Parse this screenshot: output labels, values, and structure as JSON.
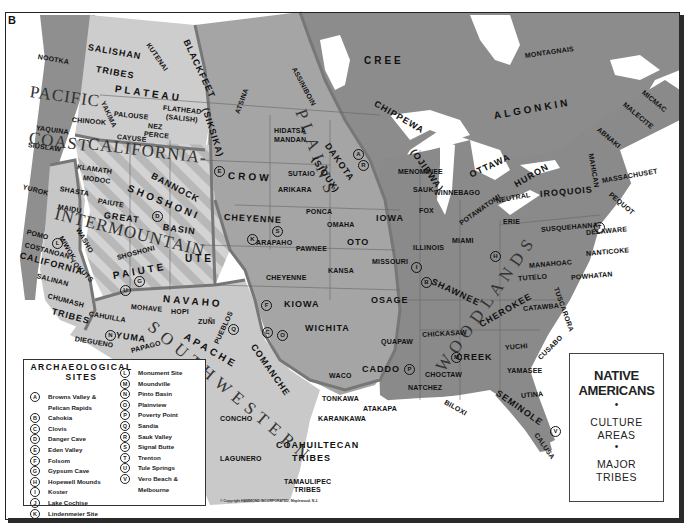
{
  "corner_label": "B",
  "title_box": {
    "title_line1": "NATIVE",
    "title_line2": "AMERICANS",
    "bullet": "•",
    "sub1_line1": "CULTURE",
    "sub1_line2": "AREAS",
    "sub2_line1": "MAJOR",
    "sub2_line2": "TRIBES"
  },
  "legend": {
    "title_line1": "ARCHAEOLOGICAL",
    "title_line2": "SITES",
    "left": [
      {
        "key": "A",
        "name": "Browns Valley &",
        "name2": "Pelican Rapids"
      },
      {
        "key": "B",
        "name": "Cahokia"
      },
      {
        "key": "C",
        "name": "Clovis"
      },
      {
        "key": "D",
        "name": "Danger Cave"
      },
      {
        "key": "E",
        "name": "Eden Valley"
      },
      {
        "key": "F",
        "name": "Folsom"
      },
      {
        "key": "G",
        "name": "Gypsum Cave"
      },
      {
        "key": "H",
        "name": "Hopewell Mounds"
      },
      {
        "key": "I",
        "name": "Koster"
      },
      {
        "key": "J",
        "name": "Lake Cochise"
      },
      {
        "key": "K",
        "name": "Lindenmeier Site"
      }
    ],
    "right": [
      {
        "key": "L",
        "name": "Monument Site"
      },
      {
        "key": "M",
        "name": "Moundville"
      },
      {
        "key": "N",
        "name": "Pinto Basin"
      },
      {
        "key": "O",
        "name": "Plainview"
      },
      {
        "key": "P",
        "name": "Poverty Point"
      },
      {
        "key": "Q",
        "name": "Sandia"
      },
      {
        "key": "R",
        "name": "Sauk Valley"
      },
      {
        "key": "S",
        "name": "Signal Butte"
      },
      {
        "key": "T",
        "name": "Trenton"
      },
      {
        "key": "U",
        "name": "Tule Springs"
      },
      {
        "key": "V",
        "name": "Vero Beach &",
        "name2": "Melbourne"
      }
    ]
  },
  "copyright": "© Copyright HAMMOND INCORPORATED, Maplewood, N.J.",
  "culture_areas": [
    {
      "id": "pacific",
      "text": "PACIFIC",
      "x": 30,
      "y": 82,
      "rot": 8
    },
    {
      "id": "coast",
      "text": "COAST",
      "x": 29,
      "y": 128,
      "rot": 8
    },
    {
      "id": "california1",
      "text": "CALIFORNIA-",
      "x": 88,
      "y": 134,
      "rot": 7
    },
    {
      "id": "intermountain",
      "text": "INTERMOUNTAIN",
      "x": 55,
      "y": 204,
      "rot": 14
    },
    {
      "id": "plains",
      "text": "P  L  A  I  N  S",
      "x": 300,
      "y": 100,
      "rot": 70
    },
    {
      "id": "southwestern",
      "text": "S O U T H W E S T E R N",
      "x": 150,
      "y": 315,
      "rot": 40
    },
    {
      "id": "woodlands",
      "text": "W O O D L A N D S",
      "x": 440,
      "y": 360,
      "rot": -55
    }
  ],
  "tribes": [
    {
      "t": "NOOTKA",
      "x": 38,
      "y": 53,
      "rot": 10
    },
    {
      "t": "SALISHAN",
      "x": 88,
      "y": 42,
      "rot": 10,
      "c": "mid"
    },
    {
      "t": "TRIBES",
      "x": 96,
      "y": 64,
      "rot": 10,
      "c": "mid"
    },
    {
      "t": "KUTENAI",
      "x": 148,
      "y": 40,
      "rot": 55
    },
    {
      "t": "BLACKFEET",
      "x": 186,
      "y": 35,
      "rot": 65,
      "c": "mid"
    },
    {
      "t": "(SIKSIKA)",
      "x": 205,
      "y": 103,
      "rot": 72,
      "c": "mid"
    },
    {
      "t": "PLATEAU",
      "x": 115,
      "y": 83,
      "rot": 8,
      "c": "big"
    },
    {
      "t": "FLATHEAD",
      "x": 163,
      "y": 104,
      "rot": 6
    },
    {
      "t": "(SALISH)",
      "x": 166,
      "y": 113,
      "rot": 6
    },
    {
      "t": "YAKIMA",
      "x": 103,
      "y": 98,
      "rot": 65
    },
    {
      "t": "PALOUSE",
      "x": 114,
      "y": 110,
      "rot": 6
    },
    {
      "t": "CHINOOK",
      "x": 72,
      "y": 116,
      "rot": 5
    },
    {
      "t": "NEZ",
      "x": 148,
      "y": 122,
      "rot": 6
    },
    {
      "t": "PERCE",
      "x": 144,
      "y": 130,
      "rot": 6
    },
    {
      "t": "CAYUSE",
      "x": 117,
      "y": 133,
      "rot": 6
    },
    {
      "t": "YAQUINA",
      "x": 36,
      "y": 124,
      "rot": 8
    },
    {
      "t": "SIUSLAW",
      "x": 28,
      "y": 141,
      "rot": 8
    },
    {
      "t": "KLAMATH",
      "x": 77,
      "y": 163,
      "rot": 8
    },
    {
      "t": "MODOC",
      "x": 83,
      "y": 174,
      "rot": 8
    },
    {
      "t": "BANNOCK",
      "x": 152,
      "y": 170,
      "rot": 28,
      "c": "mid"
    },
    {
      "t": "SHOSHONI",
      "x": 128,
      "y": 182,
      "rot": 22,
      "c": "big"
    },
    {
      "t": "YUROK",
      "x": 23,
      "y": 183,
      "rot": 15
    },
    {
      "t": "SHASTA",
      "x": 60,
      "y": 185,
      "rot": 10
    },
    {
      "t": "PAIUTE",
      "x": 98,
      "y": 197,
      "rot": 10
    },
    {
      "t": "MAIDU",
      "x": 58,
      "y": 203,
      "rot": 10
    },
    {
      "t": "GREAT",
      "x": 104,
      "y": 210,
      "rot": 8,
      "c": "mid"
    },
    {
      "t": "BASIN",
      "x": 163,
      "y": 222,
      "rot": 8,
      "c": "mid"
    },
    {
      "t": "WASHO",
      "x": 78,
      "y": 225,
      "rot": 60
    },
    {
      "t": "POMO",
      "x": 27,
      "y": 228,
      "rot": 15
    },
    {
      "t": "MIWOK",
      "x": 61,
      "y": 233,
      "rot": 60
    },
    {
      "t": "COSTANOAN",
      "x": 25,
      "y": 241,
      "rot": 15
    },
    {
      "t": "CALIFORNIA",
      "x": 20,
      "y": 250,
      "rot": 15,
      "c": "mid"
    },
    {
      "t": "YOKUTS",
      "x": 71,
      "y": 256,
      "rot": 45
    },
    {
      "t": "UTE",
      "x": 185,
      "y": 253,
      "rot": 0,
      "c": "big"
    },
    {
      "t": "SHOSHONI",
      "x": 117,
      "y": 254,
      "rot": -15
    },
    {
      "t": "PAIUTE",
      "x": 113,
      "y": 270,
      "rot": -10,
      "c": "big"
    },
    {
      "t": "SALINAN",
      "x": 37,
      "y": 272,
      "rot": 15
    },
    {
      "t": "CHUMASH",
      "x": 48,
      "y": 292,
      "rot": 15
    },
    {
      "t": "TRIBES",
      "x": 52,
      "y": 306,
      "rot": 15,
      "c": "mid"
    },
    {
      "t": "CAHUILLA",
      "x": 89,
      "y": 310,
      "rot": 10
    },
    {
      "t": "DIEGUENO",
      "x": 75,
      "y": 335,
      "rot": 10
    },
    {
      "t": "YUMA",
      "x": 116,
      "y": 330,
      "rot": 8,
      "c": "mid"
    },
    {
      "t": "MOHAVE",
      "x": 131,
      "y": 303,
      "rot": 5
    },
    {
      "t": "NAVAHO",
      "x": 163,
      "y": 293,
      "rot": 5,
      "c": "big"
    },
    {
      "t": "HOPI",
      "x": 171,
      "y": 308,
      "rot": 0
    },
    {
      "t": "ZUÑI",
      "x": 198,
      "y": 318,
      "rot": 0
    },
    {
      "t": "PAPAGO",
      "x": 131,
      "y": 347,
      "rot": -15
    },
    {
      "t": "PIMA",
      "x": 151,
      "y": 362,
      "rot": 5
    },
    {
      "t": "PUEBLOS",
      "x": 216,
      "y": 340,
      "rot": -65
    },
    {
      "t": "APACHE",
      "x": 185,
      "y": 330,
      "rot": 30,
      "c": "big"
    },
    {
      "t": "ATSINA",
      "x": 237,
      "y": 110,
      "rot": -70
    },
    {
      "t": "ASSINIBOIN",
      "x": 294,
      "y": 64,
      "rot": 62
    },
    {
      "t": "CROW",
      "x": 228,
      "y": 170,
      "rot": 3,
      "c": "big"
    },
    {
      "t": "HIDATSA",
      "x": 274,
      "y": 127,
      "rot": 0
    },
    {
      "t": "MANDAN",
      "x": 274,
      "y": 136,
      "rot": 0
    },
    {
      "t": "DAKOTA",
      "x": 327,
      "y": 139,
      "rot": 55,
      "c": "mid"
    },
    {
      "t": "(SIOUX)",
      "x": 314,
      "y": 153,
      "rot": 55,
      "c": "mid"
    },
    {
      "t": "SUTAIO",
      "x": 288,
      "y": 170,
      "rot": 0
    },
    {
      "t": "ARIKARA",
      "x": 278,
      "y": 186,
      "rot": 0
    },
    {
      "t": "CHEYENNE",
      "x": 224,
      "y": 212,
      "rot": 3,
      "c": "mid"
    },
    {
      "t": "PONCA",
      "x": 306,
      "y": 208,
      "rot": 0
    },
    {
      "t": "OMAHA",
      "x": 327,
      "y": 221,
      "rot": 0
    },
    {
      "t": "ARAPAHO",
      "x": 256,
      "y": 239,
      "rot": 0
    },
    {
      "t": "OTO",
      "x": 347,
      "y": 237,
      "rot": 0,
      "c": "mid"
    },
    {
      "t": "PAWNEE",
      "x": 296,
      "y": 245,
      "rot": 0
    },
    {
      "t": "KANSA",
      "x": 328,
      "y": 267,
      "rot": 0
    },
    {
      "t": "CHEYENNE",
      "x": 266,
      "y": 274,
      "rot": 0
    },
    {
      "t": "KIOWA",
      "x": 284,
      "y": 299,
      "rot": 0,
      "c": "mid"
    },
    {
      "t": "WICHITA",
      "x": 305,
      "y": 323,
      "rot": 0,
      "c": "mid"
    },
    {
      "t": "COMANCHE",
      "x": 253,
      "y": 340,
      "rot": 55,
      "c": "mid"
    },
    {
      "t": "IOWA",
      "x": 376,
      "y": 213,
      "rot": 0,
      "c": "mid"
    },
    {
      "t": "MISSOURI",
      "x": 372,
      "y": 258,
      "rot": 0
    },
    {
      "t": "OSAGE",
      "x": 371,
      "y": 295,
      "rot": 0,
      "c": "mid"
    },
    {
      "t": "QUAPAW",
      "x": 381,
      "y": 338,
      "rot": 0
    },
    {
      "t": "CADDO",
      "x": 362,
      "y": 364,
      "rot": 0,
      "c": "mid"
    },
    {
      "t": "WACO",
      "x": 329,
      "y": 372,
      "rot": 0
    },
    {
      "t": "TONKAWA",
      "x": 322,
      "y": 395,
      "rot": 0
    },
    {
      "t": "KARANKAWA",
      "x": 318,
      "y": 415,
      "rot": 0
    },
    {
      "t": "ATAKAPA",
      "x": 363,
      "y": 405,
      "rot": 0
    },
    {
      "t": "COAHUILTECAN",
      "x": 276,
      "y": 440,
      "rot": 0,
      "c": "mid"
    },
    {
      "t": "TRIBES",
      "x": 292,
      "y": 453,
      "rot": 0,
      "c": "mid"
    },
    {
      "t": "TAMAULIPEC",
      "x": 284,
      "y": 478,
      "rot": 0
    },
    {
      "t": "TRIBES",
      "x": 294,
      "y": 486,
      "rot": 0
    },
    {
      "t": "CONCHO",
      "x": 220,
      "y": 415,
      "rot": 0
    },
    {
      "t": "LAGUNERO",
      "x": 220,
      "y": 455,
      "rot": 0
    },
    {
      "t": "CREE",
      "x": 364,
      "y": 55,
      "rot": 0,
      "c": "big"
    },
    {
      "t": "MONTAGNAIS",
      "x": 525,
      "y": 52,
      "rot": -8
    },
    {
      "t": "CHIPPEWA",
      "x": 375,
      "y": 98,
      "rot": 30,
      "c": "mid"
    },
    {
      "t": "ALGONKIN",
      "x": 494,
      "y": 110,
      "rot": -10,
      "c": "big"
    },
    {
      "t": "(OJIBWA)",
      "x": 413,
      "y": 145,
      "rot": 55,
      "c": "mid"
    },
    {
      "t": "OTTAWA",
      "x": 470,
      "y": 170,
      "rot": -25,
      "c": "mid"
    },
    {
      "t": "MENOMINEE",
      "x": 398,
      "y": 168,
      "rot": 0
    },
    {
      "t": "SAUK",
      "x": 413,
      "y": 186,
      "rot": 0
    },
    {
      "t": "WINNEBAGO",
      "x": 434,
      "y": 189,
      "rot": 0
    },
    {
      "t": "FOX",
      "x": 419,
      "y": 207,
      "rot": 0
    },
    {
      "t": "POTAWATOMI",
      "x": 460,
      "y": 220,
      "rot": -35
    },
    {
      "t": "NEUTRAL",
      "x": 496,
      "y": 197,
      "rot": -10
    },
    {
      "t": "HURON",
      "x": 515,
      "y": 180,
      "rot": -30,
      "c": "mid"
    },
    {
      "t": "IROQUOIS",
      "x": 540,
      "y": 189,
      "rot": -5,
      "c": "mid"
    },
    {
      "t": "ERIE",
      "x": 503,
      "y": 218,
      "rot": 0
    },
    {
      "t": "ILLINOIS",
      "x": 413,
      "y": 244,
      "rot": 0
    },
    {
      "t": "MIAMI",
      "x": 452,
      "y": 237,
      "rot": 0
    },
    {
      "t": "SHAWNEE",
      "x": 432,
      "y": 276,
      "rot": 25,
      "c": "mid"
    },
    {
      "t": "SUSQUEHANNA",
      "x": 541,
      "y": 226,
      "rot": -5
    },
    {
      "t": "DELAWARE",
      "x": 586,
      "y": 229,
      "rot": -5
    },
    {
      "t": "NANTICOKE",
      "x": 586,
      "y": 250,
      "rot": -5
    },
    {
      "t": "MANAHOAC",
      "x": 529,
      "y": 262,
      "rot": -5
    },
    {
      "t": "TUTELO",
      "x": 518,
      "y": 275,
      "rot": -5
    },
    {
      "t": "POWHATAN",
      "x": 571,
      "y": 274,
      "rot": -5
    },
    {
      "t": "TUSCARORA",
      "x": 556,
      "y": 284,
      "rot": 70
    },
    {
      "t": "CATAWBA",
      "x": 523,
      "y": 305,
      "rot": -5
    },
    {
      "t": "CHEROKEE",
      "x": 480,
      "y": 320,
      "rot": -30,
      "c": "mid"
    },
    {
      "t": "CHICKASAW",
      "x": 422,
      "y": 331,
      "rot": -3
    },
    {
      "t": "CREEK",
      "x": 456,
      "y": 352,
      "rot": 0,
      "c": "mid"
    },
    {
      "t": "YUCHI",
      "x": 505,
      "y": 344,
      "rot": -5
    },
    {
      "t": "CUSABO",
      "x": 539,
      "y": 355,
      "rot": -45
    },
    {
      "t": "CHOCTAW",
      "x": 425,
      "y": 371,
      "rot": 0
    },
    {
      "t": "YAMASEE",
      "x": 507,
      "y": 367,
      "rot": 0
    },
    {
      "t": "NATCHEZ",
      "x": 408,
      "y": 384,
      "rot": 0
    },
    {
      "t": "SEMINOLE",
      "x": 497,
      "y": 387,
      "rot": 35,
      "c": "mid"
    },
    {
      "t": "UTINA",
      "x": 521,
      "y": 392,
      "rot": -5
    },
    {
      "t": "BILOXI",
      "x": 445,
      "y": 398,
      "rot": 30
    },
    {
      "t": "CALUSA",
      "x": 536,
      "y": 430,
      "rot": 55
    },
    {
      "t": "ABNAKI",
      "x": 598,
      "y": 125,
      "rot": 40
    },
    {
      "t": "MALECITE",
      "x": 624,
      "y": 100,
      "rot": 40
    },
    {
      "t": "MICMAC",
      "x": 643,
      "y": 88,
      "rot": 40
    },
    {
      "t": "MAHICAN",
      "x": 591,
      "y": 150,
      "rot": 80
    },
    {
      "t": "MASSACHUSET",
      "x": 602,
      "y": 177,
      "rot": -10
    },
    {
      "t": "PEQUOT",
      "x": 610,
      "y": 190,
      "rot": 40
    }
  ],
  "sites_on_map": [
    {
      "k": "A",
      "x": 353,
      "y": 149
    },
    {
      "k": "R",
      "x": 358,
      "y": 160
    },
    {
      "k": "E",
      "x": 214,
      "y": 166
    },
    {
      "k": "D",
      "x": 152,
      "y": 211
    },
    {
      "k": "S",
      "x": 272,
      "y": 226
    },
    {
      "k": "K",
      "x": 247,
      "y": 234
    },
    {
      "k": "L",
      "x": 52,
      "y": 238
    },
    {
      "k": "U",
      "x": 120,
      "y": 285
    },
    {
      "k": "G",
      "x": 134,
      "y": 276
    },
    {
      "k": "N",
      "x": 105,
      "y": 330
    },
    {
      "k": "J",
      "x": 175,
      "y": 361
    },
    {
      "k": "Q",
      "x": 228,
      "y": 324
    },
    {
      "k": "F",
      "x": 261,
      "y": 300
    },
    {
      "k": "C",
      "x": 262,
      "y": 327
    },
    {
      "k": "O",
      "x": 277,
      "y": 330
    },
    {
      "k": "I",
      "x": 411,
      "y": 262
    },
    {
      "k": "B",
      "x": 421,
      "y": 277
    },
    {
      "k": "H",
      "x": 490,
      "y": 251
    },
    {
      "k": "M",
      "x": 451,
      "y": 352
    },
    {
      "k": "P",
      "x": 404,
      "y": 364
    },
    {
      "k": "T",
      "x": 594,
      "y": 222
    },
    {
      "k": "V",
      "x": 550,
      "y": 426
    }
  ]
}
